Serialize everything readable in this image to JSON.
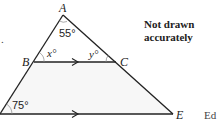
{
  "diagram": {
    "type": "geometry",
    "vertices": {
      "A": {
        "label": "A"
      },
      "B": {
        "label": "B"
      },
      "C": {
        "label": "C"
      },
      "E": {
        "label": "E"
      }
    },
    "angles": {
      "at_A": "55°",
      "at_B": "x°",
      "at_C": "y°",
      "bottom_left": "75°"
    },
    "parallel_marks": [
      "BC",
      "base"
    ],
    "note_line1": "Not drawn",
    "note_line2": "accurately",
    "stray_text_right": "Ed",
    "stray_text_left": "."
  }
}
